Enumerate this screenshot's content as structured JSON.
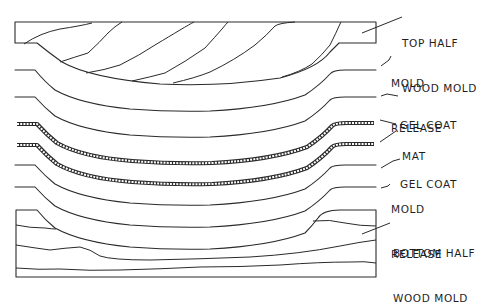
{
  "diagram": {
    "colors": {
      "line": "#2a2a2a",
      "background": "#ffffff",
      "text": "#1e1e1e"
    },
    "labels": {
      "top_half_mold": [
        "TOP HALF",
        "WOOD MOLD"
      ],
      "mold_release_top": [
        "MOLD",
        "RELEASE"
      ],
      "gel_coat_top": [
        "GEL COAT"
      ],
      "mat": [
        "MAT"
      ],
      "gel_coat_bottom": [
        "GEL COAT"
      ],
      "mold_release_bottom": [
        "MOLD",
        "RELEASE"
      ],
      "bottom_half_mold": [
        "BOTTOM HALF",
        "WOOD MOLD"
      ]
    },
    "layer_order_top_to_bottom": [
      "TOP HALF WOOD MOLD",
      "MOLD RELEASE",
      "GEL COAT",
      "MAT",
      "MAT",
      "GEL COAT",
      "MOLD RELEASE",
      "BOTTOM HALF WOOD MOLD"
    ]
  }
}
